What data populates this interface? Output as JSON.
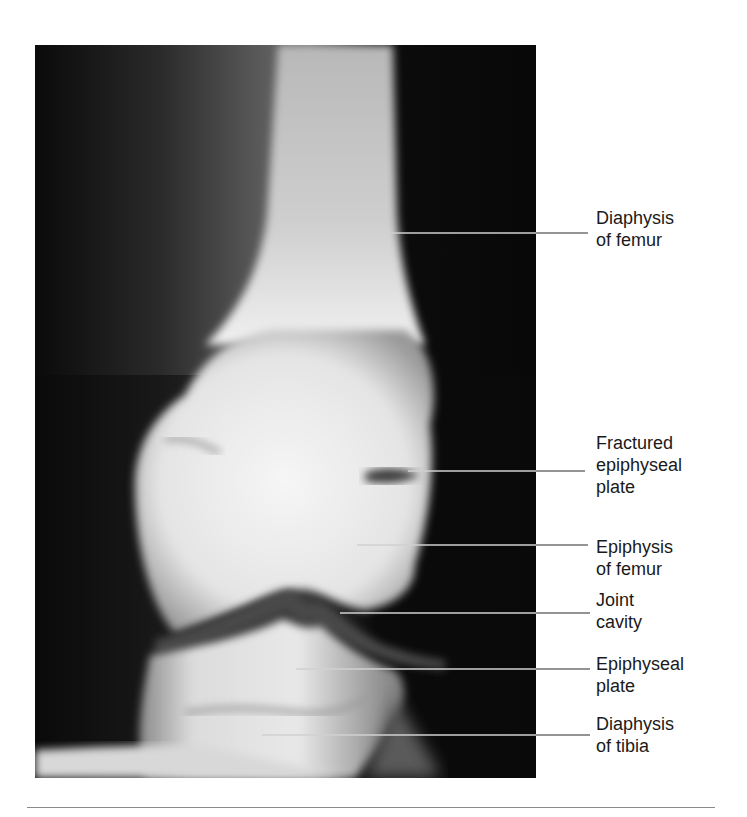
{
  "figure": {
    "image": {
      "subject": "Knee X-ray (anterior view) showing femur and tibia",
      "background_color": "#0b0b0b",
      "bone_color": "#e8e8e8"
    },
    "labels": [
      {
        "id": "diaphysis-femur",
        "text": "Diaphysis\nof femur",
        "line": {
          "x1": 347,
          "x2": 588,
          "y": 233
        },
        "top": 207
      },
      {
        "id": "fractured-epiphyseal-plate",
        "text": "Fractured\nepiphyseal\nplate",
        "line": {
          "x1": 408,
          "x2": 585,
          "y": 471
        },
        "top": 432
      },
      {
        "id": "epiphysis-femur",
        "text": "Epiphysis\nof femur",
        "line": {
          "x1": 357,
          "x2": 588,
          "y": 545
        },
        "top": 536
      },
      {
        "id": "joint-cavity",
        "text": "Joint\ncavity",
        "line": {
          "x1": 340,
          "x2": 590,
          "y": 613
        },
        "top": 589
      },
      {
        "id": "epiphyseal-plate",
        "text": "Epiphyseal\nplate",
        "line": {
          "x1": 296,
          "x2": 590,
          "y": 669
        },
        "top": 653
      },
      {
        "id": "diaphysis-tibia",
        "text": "Diaphysis\nof tibia",
        "line": {
          "x1": 262,
          "x2": 590,
          "y": 735
        },
        "top": 713
      }
    ],
    "leader_colors": {
      "on_dark": "#d0d0d0",
      "on_light": "#2a2a2a"
    }
  }
}
